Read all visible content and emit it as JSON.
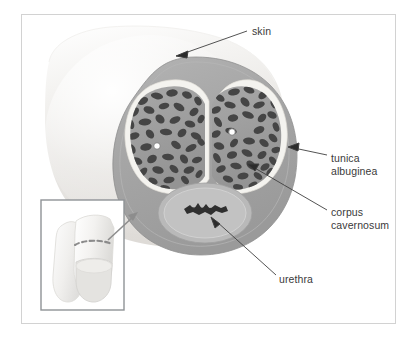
{
  "figure": {
    "title_alt": "Cross-section of the penile shaft",
    "frame": {
      "border_color": "#d2d2d2",
      "background": "#ffffff"
    },
    "labels": [
      {
        "id": "skin",
        "text": "skin",
        "x": 252,
        "y": 25
      },
      {
        "id": "tunica_albuginea",
        "line1": "tunica",
        "line2": "albuginea",
        "x": 331,
        "y": 152
      },
      {
        "id": "corpus_cavernosum",
        "line1": "corpus",
        "line2": "cavernosum",
        "x": 331,
        "y": 206
      },
      {
        "id": "urethra",
        "text": "urethra",
        "x": 279,
        "y": 273
      }
    ],
    "structures": [
      {
        "name": "skin",
        "description": "outer cylindrical shaft covering",
        "color": "#eceae8"
      },
      {
        "name": "subcutaneous-tissue",
        "description": "gray tissue ring beneath skin",
        "color": "#a9a9a9"
      },
      {
        "name": "tunica-albuginea",
        "description": "pale fibrous sheath around each corpus cavernosum",
        "color": "#f2f1ec"
      },
      {
        "name": "corpus-cavernosum-left",
        "description": "left erectile body with trabeculae",
        "color": "#9c9c9c"
      },
      {
        "name": "corpus-cavernosum-right",
        "description": "right erectile body with trabeculae",
        "color": "#9c9c9c"
      },
      {
        "name": "trabeculae",
        "description": "dark spongy cavernous tissue",
        "color": "#4a4a4a"
      },
      {
        "name": "cavernous-artery-left",
        "description": "small central white circle in left corpus",
        "color": "#ffffff"
      },
      {
        "name": "cavernous-artery-right",
        "description": "small central white circle in right corpus",
        "color": "#ffffff"
      },
      {
        "name": "corpus-spongiosum",
        "description": "ventral oval body surrounding urethra",
        "color": "#b6b6b6"
      },
      {
        "name": "urethra",
        "description": "dark slit-shaped lumen",
        "color": "#2e2e2e"
      }
    ],
    "inset": {
      "name": "whole-organ-inset",
      "description": "small illustration of the whole organ with dashed section line",
      "border_color": "#8f9396",
      "x": 41,
      "y": 200,
      "width": 83,
      "height": 110,
      "cut_line": {
        "style": "dashed",
        "color": "#8b8b8b"
      }
    },
    "pointer_arrow": {
      "name": "inset-to-section-arrow",
      "color": "#8d8d8d",
      "description": "arrow from inset up-right to cross-section"
    }
  }
}
